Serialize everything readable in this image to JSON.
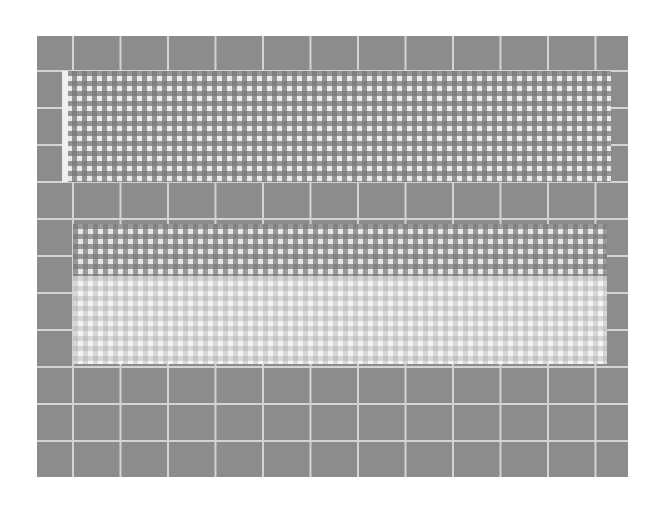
{
  "image": {
    "description": "Gray square grid test pattern with two gingham-checkered panels",
    "width": 663,
    "height": 509,
    "colors": {
      "background": "#ffffff",
      "grid_fill": "#8c8c8c",
      "grid_lines": "#d4d4d4",
      "check_dark": "#787878",
      "check_light": "#f4f4f4"
    },
    "regions": [
      {
        "name": "grid-board",
        "x": 37,
        "y": 36,
        "w": 591,
        "h": 441
      },
      {
        "name": "top-checkered-panel",
        "x": 62,
        "y": 71,
        "w": 549,
        "h": 111
      },
      {
        "name": "bottom-checkered-panel",
        "x": 73,
        "y": 224,
        "w": 534,
        "h": 140
      }
    ]
  }
}
